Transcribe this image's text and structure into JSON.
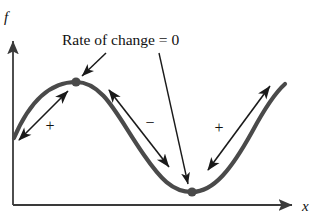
{
  "figure": {
    "type": "math-diagram",
    "background_color": "#ffffff",
    "curve_color": "#4a4a4a",
    "axis_color": "#3a3a3a",
    "annotation_color": "#1a1a1a",
    "text_color": "#111111"
  },
  "axes": {
    "y_label": "f",
    "x_label": "x",
    "origin": {
      "x": 13,
      "y": 205
    },
    "y_top": {
      "x": 13,
      "y": 38
    },
    "x_right": {
      "x": 296,
      "y": 205
    },
    "y_label_pos": {
      "x": 4,
      "y": 22
    },
    "x_label_pos": {
      "x": 302,
      "y": 211
    }
  },
  "annotation": {
    "label": "Rate of change = 0",
    "label_pos": {
      "x": 62,
      "y": 45
    },
    "pointers": [
      {
        "name": "pointer-to-maximum",
        "from": {
          "x": 106,
          "y": 53
        },
        "to": {
          "x": 80,
          "y": 78
        }
      },
      {
        "name": "pointer-to-minimum",
        "from": {
          "x": 159,
          "y": 53
        },
        "to": {
          "x": 188,
          "y": 185
        }
      }
    ]
  },
  "curve": {
    "name": "function-curve",
    "path": "M 14,138 C 28,105 48,82 76,82 C 104,82 118,118 144,155 C 160,178 172,192 192,192 C 214,192 232,168 252,132 C 266,106 276,92 285,84",
    "stroke_width": 4.2
  },
  "critical_points": [
    {
      "name": "maximum-point",
      "x": 76,
      "y": 82,
      "r": 4.6,
      "label": "local maximum"
    },
    {
      "name": "minimum-point",
      "x": 192,
      "y": 192,
      "r": 4.6,
      "label": "local minimum"
    }
  ],
  "slope_arrows": [
    {
      "name": "slope-arrow-increasing-left",
      "sign": "+",
      "sign_pos": {
        "x": 50,
        "y": 131
      },
      "from": {
        "x": 17,
        "y": 142
      },
      "to": {
        "x": 70,
        "y": 89
      }
    },
    {
      "name": "slope-arrow-decreasing-middle",
      "sign": "−",
      "sign_pos": {
        "x": 150,
        "y": 128
      },
      "from": {
        "x": 107,
        "y": 88
      },
      "to": {
        "x": 171,
        "y": 169
      }
    },
    {
      "name": "slope-arrow-increasing-right",
      "sign": "+",
      "sign_pos": {
        "x": 219,
        "y": 133
      },
      "from": {
        "x": 206,
        "y": 172
      },
      "to": {
        "x": 272,
        "y": 84
      }
    }
  ]
}
